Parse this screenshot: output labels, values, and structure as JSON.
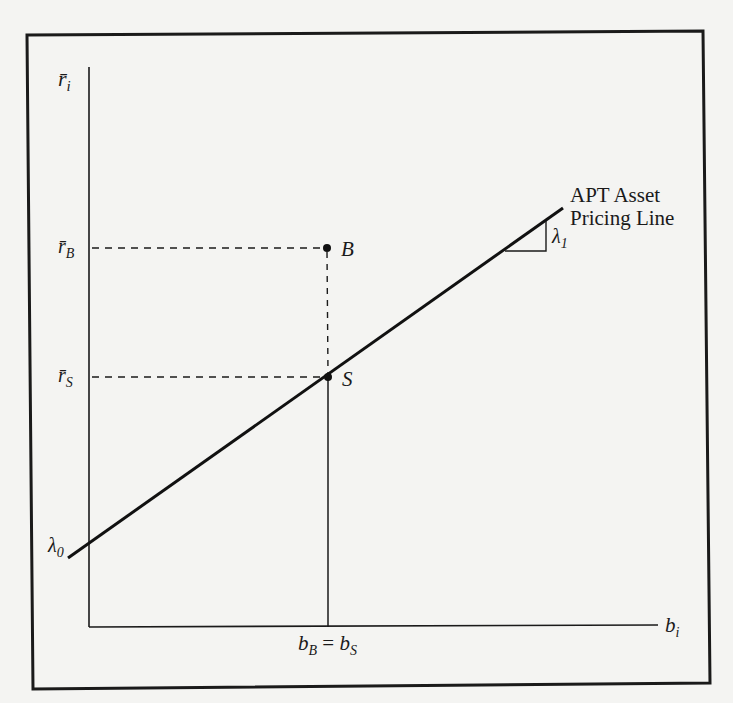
{
  "figure": {
    "y_axis_label": "r̄",
    "y_axis_sub": "i",
    "x_axis_label": "b",
    "x_axis_sub": "i",
    "line_label_1": "APT Asset",
    "line_label_2": "Pricing Line",
    "intercept_label": "λ",
    "intercept_sub": "0",
    "slope_label": "λ",
    "slope_sub": "1",
    "point_B": "B",
    "point_S": "S",
    "rB_label": "r̄",
    "rB_sub": "B",
    "rS_label": "r̄",
    "rS_sub": "S",
    "bx_label_1": "b",
    "bx_sub_1": "B",
    "bx_eq": " = ",
    "bx_label_2": "b",
    "bx_sub_2": "S"
  },
  "colors": {
    "ink": "#1a1a1a",
    "paper": "#f4f4f2"
  }
}
